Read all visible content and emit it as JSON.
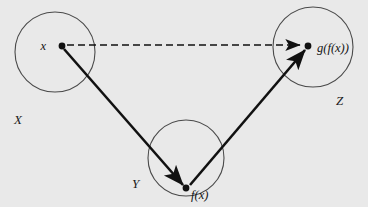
{
  "figure": {
    "panel": {
      "background_color": "#e9e9e9",
      "x": 0,
      "y": 0,
      "width": 368,
      "height": 207
    },
    "page_background_color": "#ffffff",
    "stroke_color": "#111111",
    "circle_stroke_color": "#4a4a4a"
  },
  "sets": [
    {
      "name": "X",
      "label": "X",
      "cx": 55,
      "cy": 52,
      "r": 40,
      "label_x": 14,
      "label_y": 124
    },
    {
      "name": "Y",
      "label": "Y",
      "cx": 186,
      "cy": 158,
      "r": 38,
      "label_x": 132,
      "label_y": 188
    },
    {
      "name": "Z",
      "label": "Z",
      "cx": 313,
      "cy": 47,
      "r": 40,
      "label_x": 336,
      "label_y": 105
    }
  ],
  "points": [
    {
      "name": "x",
      "label": "x",
      "cx": 62,
      "cy": 46,
      "label_x": 46,
      "label_y": 50,
      "anchor": "end"
    },
    {
      "name": "f(x)",
      "label": "f(x)",
      "cx": 186,
      "cy": 188,
      "label_x": 191,
      "label_y": 199,
      "anchor": "start"
    },
    {
      "name": "g(f(x))",
      "label": "g(f(x))",
      "cx": 308,
      "cy": 46,
      "label_x": 317,
      "label_y": 52,
      "anchor": "start"
    }
  ],
  "arrows": [
    {
      "name": "f-map",
      "from": "x",
      "to": "f(x)",
      "style": "solid",
      "x1": 64,
      "y1": 49,
      "x2": 183,
      "y2": 185,
      "width": 2.6
    },
    {
      "name": "g-map",
      "from": "f(x)",
      "to": "g(f(x))",
      "style": "solid",
      "x1": 190,
      "y1": 185,
      "x2": 305,
      "y2": 50,
      "width": 2.6
    },
    {
      "name": "composition-map",
      "from": "x",
      "to": "g(f(x))",
      "style": "dashed",
      "x1": 67,
      "y1": 45,
      "x2": 300,
      "y2": 45,
      "width": 1.4,
      "dash_pattern": "7,4"
    }
  ]
}
